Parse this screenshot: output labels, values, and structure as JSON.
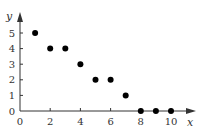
{
  "chart_data": {
    "type": "scatter",
    "title": "",
    "xlabel": "x",
    "ylabel": "y",
    "xlim": [
      0,
      10
    ],
    "ylim": [
      0,
      5
    ],
    "x_ticks": [
      "0",
      "2",
      "4",
      "6",
      "8",
      "10"
    ],
    "y_ticks": [
      "0",
      "1",
      "2",
      "3",
      "4",
      "5"
    ],
    "grid": false,
    "legend": null,
    "series": [
      {
        "name": "points",
        "x": [
          1,
          2,
          3,
          4,
          5,
          6,
          7,
          8,
          9,
          10
        ],
        "y": [
          5,
          4,
          4,
          3,
          2,
          2,
          1,
          0,
          0,
          0
        ]
      }
    ],
    "colors": {
      "axis": "#333333",
      "points": "#000000"
    }
  }
}
